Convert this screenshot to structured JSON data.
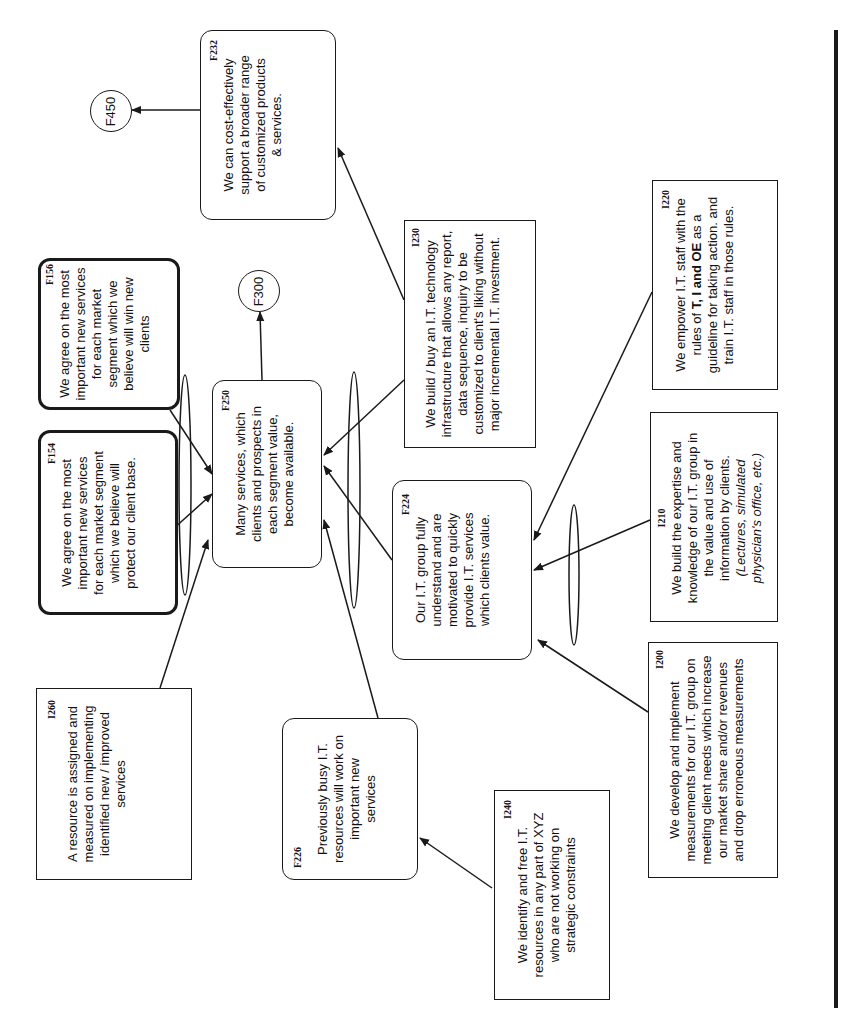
{
  "diagram": {
    "orientation": "rotated 90 degrees counterclockwise",
    "nodes": {
      "F232": {
        "ref": "F232",
        "text": "We can cost-effectively support a broader range of customized products & services.",
        "shape": "rounded"
      },
      "F450": {
        "ref": "F450",
        "shape": "circle"
      },
      "F156": {
        "ref": "F156",
        "text": "We agree on the most important new services for each market segment which we believe will win new clients",
        "shape": "rounded-thick"
      },
      "F154": {
        "ref": "F154",
        "text": "We agree on the most important new services for each market segment which we believe will protect our client base.",
        "shape": "rounded-thick"
      },
      "I260": {
        "ref": "I260",
        "text": "A resource is assigned and measured on implementing identified new / improved services",
        "shape": "rectangle"
      },
      "F250": {
        "ref": "F250",
        "text": "Many services, which clients and prospects in each segment value, become available.",
        "shape": "rounded"
      },
      "F300": {
        "ref": "F300",
        "shape": "circle"
      },
      "I230": {
        "ref": "I230",
        "text": "We build / buy an I.T. technology infrastructure that allows any report, data sequence, inquiry to be customized to client's liking without major incremental I.T. investment.",
        "shape": "rectangle"
      },
      "F224": {
        "ref": "F224",
        "text": "Our I.T. group fully understand and are motivated to quickly provide I.T. services which clients value.",
        "shape": "rounded"
      },
      "F226": {
        "ref": "F226",
        "text": "Previously busy I.T. resources will work on important new services",
        "shape": "rounded"
      },
      "I220": {
        "ref": "I220",
        "text_before": "We empower I.T. staff with the rules of ",
        "text_bold": "T, I and OE",
        "text_after": " as a guideline for taking action. and train I.T. staff in those rules.",
        "shape": "rectangle"
      },
      "I210": {
        "ref": "I210",
        "text": "We build the expertise and knowledge of our I.T. group in the value and use of information by clients.",
        "text_italic": "(Lectures, simulated physician's office, etc.)",
        "shape": "rectangle"
      },
      "I200": {
        "ref": "I200",
        "text": "We develop and implement measurements for our I.T. group on meeting client needs which increase our market share and/or revenues and drop erroneous measurements",
        "shape": "rectangle"
      },
      "I240": {
        "ref": "I240",
        "text": "We identify and free I.T. resources in any part of XYZ who are not working on strategic constraints",
        "shape": "rectangle"
      }
    },
    "edges": [
      {
        "from": "F232",
        "to": "F450"
      },
      {
        "from": "I230",
        "to": "F232"
      },
      {
        "from": "F250",
        "to": "F300"
      },
      {
        "from": "F156",
        "to": "F250",
        "and_group": "left"
      },
      {
        "from": "F154",
        "to": "F250",
        "and_group": "left"
      },
      {
        "from": "I260",
        "to": "F250",
        "and_group": "left"
      },
      {
        "from": "I230",
        "to": "F250",
        "and_group": "right"
      },
      {
        "from": "F224",
        "to": "F250",
        "and_group": "right"
      },
      {
        "from": "F226",
        "to": "F250",
        "and_group": "right"
      },
      {
        "from": "I220",
        "to": "F224",
        "and_group": "f224"
      },
      {
        "from": "I210",
        "to": "F224",
        "and_group": "f224"
      },
      {
        "from": "I200",
        "to": "F224",
        "and_group": "f224"
      },
      {
        "from": "I240",
        "to": "F226"
      }
    ],
    "colors": {
      "ink": "#1a1a1a",
      "background": "#ffffff"
    }
  }
}
